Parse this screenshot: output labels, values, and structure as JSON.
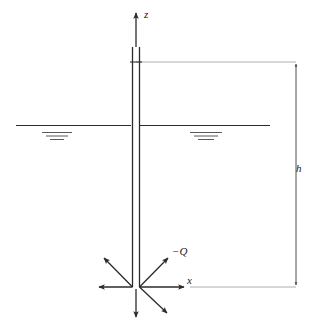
{
  "figure": {
    "background_color": "#ffffff",
    "line_color": "#2b2b2b",
    "thin_line_color": "#8a8a8a",
    "width": 316,
    "height": 325
  },
  "axes": {
    "vertical": {
      "name": "z-axis",
      "label": "z",
      "direction": "up"
    },
    "horizontal": {
      "name": "x-axis",
      "label": "x",
      "direction": "right"
    },
    "origin_label": "well bottom"
  },
  "well": {
    "name": "well casing",
    "label": "",
    "top_cap": true,
    "wall_count": 2
  },
  "water_table": {
    "name": "water table",
    "label": "",
    "symbol": "horizontal line with three tapering hatch marks",
    "sides": [
      "left",
      "right"
    ]
  },
  "dimension": {
    "name": "depth dimension",
    "label": "h",
    "description": "distance from well top to x-axis",
    "arrowheads": "both"
  },
  "discharge": {
    "name": "discharge arrows",
    "label": "−Q",
    "arrow_count": 5,
    "directions": [
      "up-left",
      "left",
      "up-right",
      "down-right",
      "down"
    ]
  }
}
